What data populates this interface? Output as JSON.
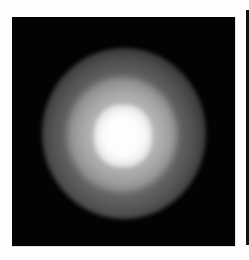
{
  "image": {
    "description": "Grayscale image of a diffuse glowing circular blob on a black background",
    "background_color": "#030303",
    "core_color": "#ffffff",
    "halo_color": "#8c8c8c",
    "page_background": "#fdfdfd",
    "edge_rule_color": "#111111"
  }
}
